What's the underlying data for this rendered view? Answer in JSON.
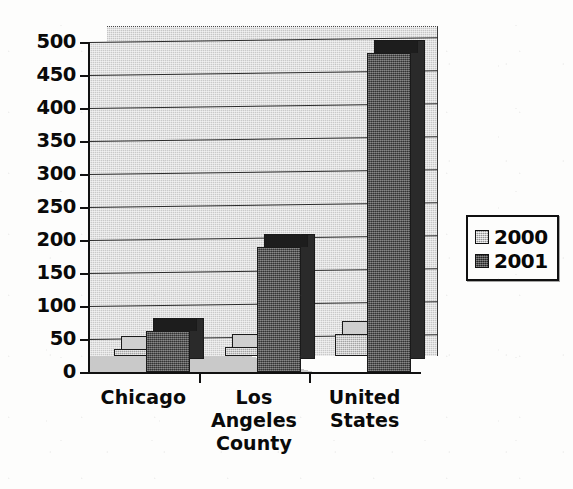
{
  "chart_data": {
    "type": "bar",
    "title": "",
    "subtitle": "",
    "xlabel": "",
    "ylabel": "",
    "categories": [
      "Chicago",
      "Los Angeles County",
      "United States"
    ],
    "category_lines": [
      [
        "Chicago"
      ],
      [
        "Los",
        "Angeles",
        "County"
      ],
      [
        "United",
        "States"
      ]
    ],
    "series": [
      {
        "name": "2000",
        "values": [
          10,
          13,
          33
        ],
        "color": "#b9b9b9"
      },
      {
        "name": "2001",
        "values": [
          62,
          190,
          483
        ],
        "color": "#4c4c4c"
      }
    ],
    "ylim": [
      0,
      500
    ],
    "ytick_step": 50,
    "yticks": [
      500,
      450,
      400,
      350,
      300,
      250,
      200,
      150,
      100,
      50,
      0
    ],
    "ytick_labels": [
      "500",
      "450",
      "400",
      "350",
      "300",
      "250",
      "200",
      "150",
      "100",
      "50",
      "0"
    ],
    "grid": true,
    "grid_axis": "y",
    "legend_position": "right",
    "style": "3d-bars-grayscale"
  },
  "legend": {
    "entries": [
      {
        "label": "2000",
        "swatch": "light-gray-pattern-swatch"
      },
      {
        "label": "2001",
        "swatch": "dark-gray-pattern-swatch"
      }
    ]
  },
  "colors": {
    "plot_background": "#c9c9c9",
    "page_background": "#fdfdfc",
    "axis": "#111111",
    "gridline": "#2b2b2b",
    "series_2000": "#b9b9b9",
    "series_2001": "#4c4c4c",
    "text": "#0a0a0a"
  }
}
